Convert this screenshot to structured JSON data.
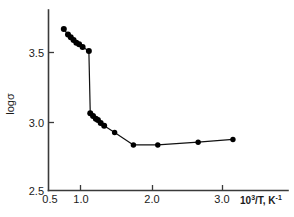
{
  "chart_data": {
    "type": "line",
    "title": "",
    "subtitle": "",
    "xlabel": "10³/T, K⁻¹",
    "ylabel": "logσ",
    "xlim": [
      0.4,
      3.45
    ],
    "ylim": [
      2.5,
      3.78
    ],
    "grid": false,
    "legend": null,
    "marker": "filled-circle",
    "line_color": "#111111",
    "marker_color": "#000000",
    "xticks": [
      0.5,
      1.0,
      2.0,
      3.0
    ],
    "xtick_labels": [
      "0.5",
      "1.0",
      "2.0",
      "3.0"
    ],
    "yticks": [
      2.5,
      3.0,
      3.5
    ],
    "ytick_labels": [
      "2.5",
      "3.0",
      "3.5"
    ],
    "annotations": [],
    "series": [
      {
        "name": "logσ vs 10³/T",
        "x": [
          0.72,
          0.78,
          0.82,
          0.86,
          0.9,
          0.94,
          0.99,
          1.08,
          1.1,
          1.14,
          1.18,
          1.21,
          1.25,
          1.3,
          1.45,
          1.72,
          2.07,
          2.65,
          3.15
        ],
        "y": [
          3.67,
          3.63,
          3.61,
          3.59,
          3.57,
          3.56,
          3.54,
          3.51,
          3.06,
          3.04,
          3.02,
          3.01,
          2.99,
          2.97,
          2.92,
          2.83,
          2.83,
          2.85,
          2.87
        ]
      }
    ]
  },
  "axes": {
    "ylabel": "logσ",
    "xlabel_base": "10",
    "xlabel_exp": "3",
    "xlabel_rest": "/T, K",
    "xlabel_rest_exp": "-1"
  }
}
